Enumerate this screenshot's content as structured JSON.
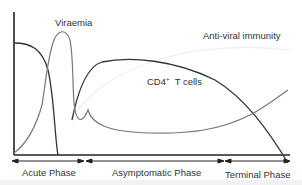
{
  "diagram": {
    "type": "HIV infection course",
    "labels": {
      "viraemia": "Viraemia",
      "antiviral_immunity": "Anti-viral immunity",
      "cd4_prefix": "CD4",
      "cd4_sup": "+",
      "cd4_suffix": "T cells"
    },
    "phases": [
      {
        "label": "Acute Phase"
      },
      {
        "label": "Asymptomatic Phase"
      },
      {
        "label": "Terminal Phase"
      }
    ],
    "series": [
      {
        "name": "CD4+ T cells",
        "color": "#333333"
      },
      {
        "name": "Viraemia",
        "color": "#777777"
      },
      {
        "name": "Anti-viral immunity",
        "color": "#eeeeee"
      }
    ],
    "colors": {
      "axis": "#222222",
      "text": "#333333"
    }
  }
}
